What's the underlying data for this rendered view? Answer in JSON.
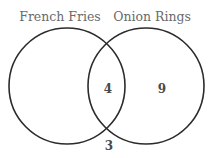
{
  "diagram": {
    "type": "venn",
    "sets": [
      {
        "name": "French Fries",
        "cx": 67,
        "cy": 86,
        "r": 58
      },
      {
        "name": "Onion Rings",
        "cx": 146,
        "cy": 86,
        "r": 58
      }
    ],
    "regions": {
      "french_fries_only": "",
      "both": "4",
      "onion_rings_only": "9",
      "neither": "3"
    },
    "stroke_color": "#2b2b2b",
    "label_color": "#6a6a6a"
  }
}
